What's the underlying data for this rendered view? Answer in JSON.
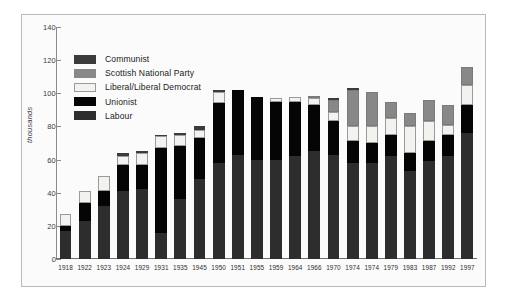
{
  "chart_data": {
    "type": "bar",
    "subtype": "stacked",
    "title": "",
    "xlabel": "",
    "ylabel": "thousands",
    "ylim": [
      0,
      140
    ],
    "yticks": [
      0,
      20,
      40,
      60,
      80,
      100,
      120,
      140
    ],
    "grid": false,
    "legend_position": "upper-left-inside",
    "categories": [
      "1918",
      "1922",
      "1923",
      "1924",
      "1929",
      "1931",
      "1935",
      "1945",
      "1950",
      "1951",
      "1955",
      "1959",
      "1964",
      "1966",
      "1970",
      "1974",
      "1974",
      "1979",
      "1983",
      "1987",
      "1992",
      "1997"
    ],
    "series": [
      {
        "name": "Labour",
        "color": "#2d2d2d",
        "values": [
          17,
          23,
          32,
          41,
          42,
          16,
          36,
          48,
          58,
          63,
          60,
          60,
          62,
          65,
          63,
          58,
          58,
          62,
          53,
          59,
          62,
          76
        ]
      },
      {
        "name": "Unionist",
        "color": "#050505",
        "values": [
          3,
          11,
          9,
          16,
          15,
          51,
          32,
          25,
          36,
          39,
          38,
          35,
          33,
          28,
          20,
          13,
          12,
          13,
          11,
          12,
          13,
          17
        ]
      },
      {
        "name": "Liberal/Liberal Democrat",
        "color": "#f2f2ee",
        "values": [
          7,
          7,
          9,
          5,
          7,
          7,
          7,
          5,
          7,
          0,
          0,
          2,
          3,
          4,
          6,
          9,
          10,
          10,
          16,
          12,
          6,
          12
        ]
      },
      {
        "name": "Scottish National Party",
        "color": "#888888",
        "values": [
          0,
          0,
          0,
          0,
          0,
          0,
          0,
          0,
          0,
          0,
          0,
          0,
          0,
          1,
          7,
          22,
          21,
          10,
          8,
          13,
          12,
          11
        ]
      },
      {
        "name": "Communist",
        "color": "#3b3b3b",
        "values": [
          0,
          0,
          0,
          2,
          1,
          1,
          1,
          2,
          1,
          0,
          0,
          0,
          0,
          0,
          1,
          1,
          0,
          0,
          0,
          0,
          0,
          0
        ]
      }
    ],
    "legend_order": [
      "Communist",
      "Scottish National Party",
      "Liberal/Liberal Democrat",
      "Unionist",
      "Labour"
    ]
  },
  "legend": {
    "items": [
      {
        "label": "Communist",
        "color": "#3b3b3b",
        "border": "#3b3b3b"
      },
      {
        "label": "Scottish National Party",
        "color": "#888888",
        "border": "#888888"
      },
      {
        "label": "Liberal/Liberal Democrat",
        "color": "#f2f2ee",
        "border": "#9a9a9a"
      },
      {
        "label": "Unionist",
        "color": "#050505",
        "border": "#050505"
      },
      {
        "label": "Labour",
        "color": "#2d2d2d",
        "border": "#2d2d2d"
      }
    ]
  },
  "axis": {
    "y_label": "thousands",
    "y_ticks": [
      "140",
      "120",
      "100",
      "80",
      "60",
      "40",
      "20",
      "0"
    ],
    "x_ticks": [
      "1918",
      "1922",
      "1923",
      "1924",
      "1929",
      "1931",
      "1935",
      "1945",
      "1950",
      "1951",
      "1955",
      "1959",
      "1964",
      "1966",
      "1970",
      "1974",
      "1974",
      "1979",
      "1983",
      "1987",
      "1992",
      "1997"
    ]
  },
  "colors": {
    "background": "#ffffff",
    "panel": "#fbfbfb",
    "frame": "#b9b9b9",
    "axis": "#8c8c8c",
    "text": "#2e2e2e"
  }
}
